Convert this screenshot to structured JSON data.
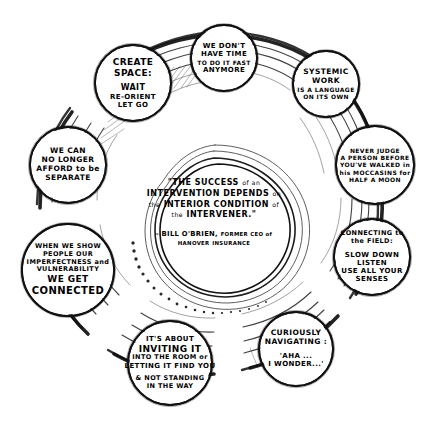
{
  "diagram": {
    "style": "hand-drawn concentric rings with circular text bubbles",
    "ink_color": "#111111",
    "background_color": "#ffffff",
    "center": {
      "quote_lines": [
        "\"THE SUCCESS",
        "of an",
        "INTERVENTION DEPENDS",
        "on the",
        "INTERIOR CONDITION",
        "of the",
        "INTERVENER.\""
      ],
      "quote_text": "\"THE SUCCESS of an INTERVENTION DEPENDS on the INTERIOR CONDITION of the INTERVENER.\"",
      "attribution_name": "- BILL O'BRIEN,",
      "attribution_role_lines": [
        "FORMER CEO of",
        "HANOVER",
        "INSURANCE"
      ],
      "attribution_role": "FORMER CEO of HANOVER INSURANCE"
    },
    "bubbles": [
      {
        "id": "create-space",
        "heading": [
          "CREATE",
          "SPACE:"
        ],
        "body": [
          "WAIT",
          "RE-ORIENT",
          "LET GO"
        ]
      },
      {
        "id": "no-time-fast",
        "heading": [
          "WE DON'T",
          "HAVE TIME"
        ],
        "body": [
          "TO DO IT FAST",
          "ANYMORE"
        ]
      },
      {
        "id": "systemic-work",
        "heading": [
          "SYSTEMIC",
          "WORK"
        ],
        "body": [
          "IS A LANGUAGE",
          "ON ITS OWN"
        ]
      },
      {
        "id": "never-judge",
        "heading": [],
        "body": [
          "NEVER JUDGE",
          "A PERSON BEFORE",
          "YOU'VE WALKED in",
          "his MOCCASINS for",
          "HALF A MOON"
        ]
      },
      {
        "id": "connecting-field",
        "heading": [
          "CONNECTING to",
          "the FIELD:"
        ],
        "body": [
          "SLOW DOWN",
          "LISTEN",
          "USE ALL YOUR",
          "SENSES"
        ]
      },
      {
        "id": "curiously-navigating",
        "heading": [
          "CURIOUSLY",
          "NAVIGATING :"
        ],
        "body": [
          "'AHA ...",
          "I WONDER...'"
        ]
      },
      {
        "id": "inviting-it-in",
        "heading": [
          "IT'S ABOUT",
          "INVITING IT"
        ],
        "body": [
          "INTO THE ROOM or",
          "LETTING IT FIND YOU",
          "& NOT STANDING",
          "IN THE WAY"
        ]
      },
      {
        "id": "we-get-connected",
        "heading": [],
        "body": [
          "WHEN WE SHOW",
          "PEOPLE OUR",
          "IMPERFECTNESS and",
          "VULNERABILITY",
          "WE GET",
          "CONNECTED"
        ]
      },
      {
        "id": "no-longer-separate",
        "heading": [],
        "body": [
          "WE CAN",
          "NO LONGER",
          "AFFORD to be",
          "SEPARATE"
        ]
      }
    ]
  }
}
